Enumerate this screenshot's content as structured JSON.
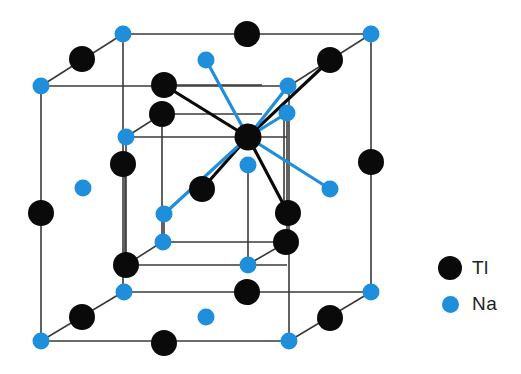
{
  "colors": {
    "tl": "#0a0a0a",
    "na": "#1f8fdc",
    "edge": "#3a3a3a",
    "background": "#ffffff"
  },
  "legend": {
    "items": [
      {
        "symbol": "black-circle",
        "label": "Tl"
      },
      {
        "symbol": "blue-circle",
        "label": "Na"
      }
    ]
  }
}
